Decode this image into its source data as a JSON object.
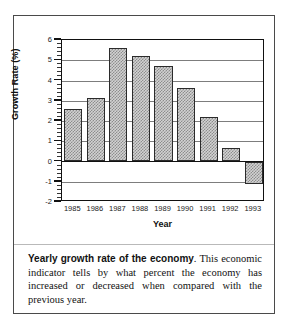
{
  "chart_data": {
    "type": "bar",
    "title": "",
    "xlabel": "Year",
    "ylabel": "Growth Rate (%)",
    "categories": [
      "1985",
      "1986",
      "1987",
      "1988",
      "1989",
      "1990",
      "1991",
      "1992",
      "1993"
    ],
    "values": [
      2.6,
      3.15,
      5.6,
      5.2,
      4.7,
      3.65,
      2.2,
      0.65,
      -1.1
    ],
    "ylim": [
      -2,
      6
    ],
    "yticks": [
      -2,
      -1,
      0,
      1,
      2,
      3,
      4,
      5,
      6
    ],
    "yticklabels": [
      "-2",
      "-1",
      "0",
      "1",
      "2",
      "3",
      "4",
      "5",
      "6"
    ],
    "grid": true,
    "legend": null,
    "bar_fill": "#d2d2d2",
    "bar_hatch": "crosshatch",
    "bar_edge_color": "#2b2b2b",
    "zero_line": 0
  },
  "caption": {
    "lead": "Yearly growth rate of the economy",
    "body": ". This economic indicator tells by what percent the economy has increased or decreased when compared with the previous year."
  }
}
